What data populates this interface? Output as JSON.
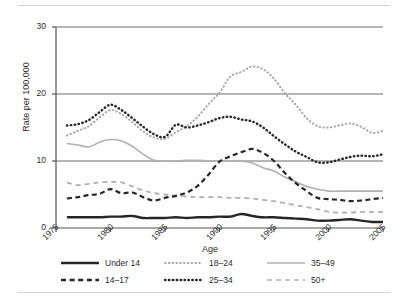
{
  "chart_data": {
    "type": "line",
    "title": "",
    "xlabel": "",
    "ylabel": "Rate per 100,000",
    "legend_title": "Age",
    "legend_position": "bottom",
    "grid": true,
    "xlim": [
      1975,
      2005
    ],
    "ylim": [
      0,
      30
    ],
    "x_ticks": [
      "1975",
      "1980",
      "1985",
      "1990",
      "1995",
      "2000",
      "2005"
    ],
    "y_ticks": [
      "0",
      "10",
      "20",
      "30"
    ],
    "x": [
      1976,
      1977,
      1978,
      1979,
      1980,
      1981,
      1982,
      1983,
      1984,
      1985,
      1986,
      1987,
      1988,
      1989,
      1990,
      1991,
      1992,
      1993,
      1994,
      1995,
      1996,
      1997,
      1998,
      1999,
      2000,
      2001,
      2002,
      2003,
      2004,
      2005
    ],
    "series": [
      {
        "name": "Under 14",
        "style": "solid",
        "color": "#262626",
        "width": 2.4,
        "values": [
          1.6,
          1.6,
          1.6,
          1.6,
          1.7,
          1.7,
          1.8,
          1.5,
          1.5,
          1.5,
          1.6,
          1.5,
          1.6,
          1.6,
          1.7,
          1.7,
          2.1,
          1.8,
          1.6,
          1.6,
          1.5,
          1.4,
          1.3,
          1.1,
          1.1,
          1.2,
          1.3,
          1.1,
          0.9,
          0.9
        ]
      },
      {
        "name": "14-17",
        "style": "dashed",
        "color": "#262626",
        "width": 2.2,
        "values": [
          4.4,
          4.6,
          4.9,
          5.1,
          5.8,
          5.2,
          5.3,
          4.6,
          4.1,
          4.5,
          4.8,
          5.3,
          6.3,
          8.0,
          9.9,
          10.7,
          11.3,
          11.8,
          11.2,
          10.0,
          8.2,
          6.7,
          5.5,
          4.5,
          4.3,
          4.2,
          4.0,
          4.1,
          4.3,
          4.5
        ]
      },
      {
        "name": "18-24",
        "style": "fine-dotted",
        "color": "#a8a8a8",
        "width": 2.0,
        "values": [
          13.8,
          14.5,
          15.2,
          16.5,
          17.6,
          17.0,
          15.8,
          14.4,
          13.5,
          13.3,
          14.3,
          15.2,
          16.6,
          18.5,
          20.2,
          22.6,
          23.3,
          24.1,
          23.7,
          22.3,
          20.1,
          18.4,
          16.4,
          15.2,
          15.0,
          15.3,
          15.6,
          15.1,
          14.2,
          14.5
        ]
      },
      {
        "name": "25-34",
        "style": "bold-dotted",
        "color": "#262626",
        "width": 2.4,
        "values": [
          15.3,
          15.5,
          16.1,
          17.3,
          18.4,
          17.6,
          16.4,
          15.1,
          14.0,
          13.6,
          15.4,
          15.0,
          15.3,
          15.8,
          16.4,
          16.6,
          16.2,
          15.9,
          15.0,
          13.7,
          12.5,
          11.4,
          10.6,
          9.8,
          9.8,
          10.2,
          10.6,
          10.8,
          10.7,
          11.0
        ]
      },
      {
        "name": "35-49",
        "style": "thin-solid",
        "color": "#b0b0b0",
        "width": 1.6,
        "values": [
          12.6,
          12.4,
          12.1,
          12.8,
          13.2,
          13.0,
          12.2,
          11.0,
          10.1,
          10.0,
          10.0,
          10.1,
          10.1,
          10.0,
          10.0,
          10.0,
          10.0,
          9.7,
          9.0,
          8.5,
          7.6,
          6.9,
          6.2,
          5.8,
          5.5,
          5.5,
          5.5,
          5.5,
          5.5,
          5.5
        ]
      },
      {
        "name": "50+",
        "style": "long-dashed",
        "color": "#b0b0b0",
        "width": 1.8,
        "values": [
          6.8,
          6.4,
          6.6,
          6.8,
          6.9,
          6.8,
          6.2,
          5.6,
          5.2,
          5.0,
          4.8,
          4.7,
          4.6,
          4.6,
          4.6,
          4.5,
          4.5,
          4.4,
          4.2,
          4.0,
          3.7,
          3.4,
          3.1,
          2.8,
          2.4,
          2.3,
          2.3,
          2.4,
          2.4,
          2.4
        ]
      }
    ]
  },
  "legend": {
    "title": "Age",
    "items": [
      {
        "label": "Under 14",
        "swatch": "solid-thick-black"
      },
      {
        "label": "18–24",
        "swatch": "fine-dotted-gray"
      },
      {
        "label": "35–49",
        "swatch": "thin-solid-gray"
      },
      {
        "label": "14–17",
        "swatch": "dashed-thick-black"
      },
      {
        "label": "25–34",
        "swatch": "bold-dotted-black"
      },
      {
        "label": "50+",
        "swatch": "long-dashed-gray"
      }
    ]
  },
  "colors": {
    "black_series": "#262626",
    "gray_series": "#b0b0b0",
    "light_gray_series": "#a8a8a8",
    "axis": "#555555",
    "gridline": "#6b6b6b",
    "rule": "#d2d2d2",
    "background": "#ffffff"
  }
}
